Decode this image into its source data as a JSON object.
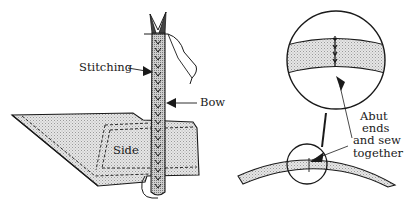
{
  "figure": {
    "left_panel": {
      "labels": {
        "stitching": "Stitching",
        "bow": "Bow",
        "side": "Side"
      }
    },
    "right_panel": {
      "labels": {
        "abut": [
          "Abut",
          "ends",
          "and sew",
          "together"
        ]
      }
    }
  },
  "colors": {
    "ink": "#1a1a1a",
    "fill_light": "#d9d9d9",
    "fill_mid": "#c4c4c4",
    "background": "#ffffff"
  }
}
